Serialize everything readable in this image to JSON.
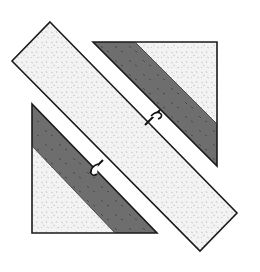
{
  "diagram": {
    "title": "Quilt block: diagonal strip with two half-square triangle units",
    "colors": {
      "background": "#ffffff",
      "light_fabric": "#f1f1f1",
      "light_print": "#c9c9c9",
      "dark_fabric": "#6b6b6b",
      "dark_print": "#3e3e3e",
      "outline": "#1a1a1a"
    },
    "pieces": [
      {
        "name": "center-diagonal-strip",
        "fabric": "light"
      },
      {
        "name": "upper-right-triangle-light",
        "fabric": "light"
      },
      {
        "name": "upper-right-dark-band",
        "fabric": "dark"
      },
      {
        "name": "lower-left-triangle-light",
        "fabric": "light"
      },
      {
        "name": "lower-left-dark-band",
        "fabric": "dark"
      }
    ],
    "markers": [
      {
        "name": "seam-marker-upper",
        "type": "connector-arrow"
      },
      {
        "name": "seam-marker-lower",
        "type": "connector-arrow"
      }
    ]
  }
}
